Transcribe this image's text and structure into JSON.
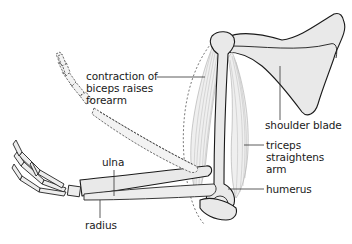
{
  "diagram": {
    "labels": {
      "biceps": [
        "contraction of",
        "biceps raises",
        "forearm"
      ],
      "shoulder_blade": [
        "shoulder blade"
      ],
      "triceps": [
        "triceps",
        "straightens",
        "arm"
      ],
      "humerus": [
        "humerus"
      ],
      "ulna": [
        "ulna"
      ],
      "radius": [
        "radius"
      ]
    },
    "parts": [
      "shoulder blade",
      "humerus",
      "biceps",
      "triceps",
      "ulna",
      "radius",
      "hand (extended position)",
      "forearm and hand (raised position, dashed)"
    ],
    "colors": {
      "bone_fill": "#e9e9e9",
      "outline": "#1a1a1a",
      "muscle_fiber": "#b5b5b5",
      "text": "#1a1a1a",
      "background": "#ffffff"
    }
  }
}
